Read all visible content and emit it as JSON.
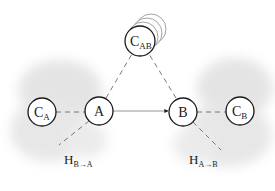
{
  "diagram": {
    "nodes": {
      "c_ab": {
        "label": "C",
        "sub": "AB"
      },
      "c_a": {
        "label": "C",
        "sub": "A"
      },
      "a": {
        "label": "A"
      },
      "b": {
        "label": "B"
      },
      "c_b": {
        "label": "C",
        "sub": "B"
      }
    },
    "annotations": {
      "h_b_to_a": {
        "label": "H",
        "sub": "B→A"
      },
      "h_a_to_b": {
        "label": "H",
        "sub": "A→B"
      }
    },
    "colors": {
      "stroke": "#1a1a1a",
      "ghost": "#8a8a8a",
      "cloud": "#e4e4e4",
      "dashed": "#6a6a6a"
    }
  }
}
